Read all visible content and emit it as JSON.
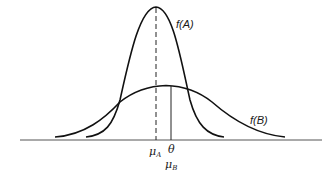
{
  "diagram": {
    "type": "overlapping-normal-distributions",
    "colors": {
      "stroke": "#111111",
      "axis": "#444444",
      "background": "#ffffff"
    },
    "curves": [
      {
        "id": "A",
        "label": "f(A)",
        "mean_symbol": "μ",
        "mean_subscript": "A",
        "shape": "narrow-tall"
      },
      {
        "id": "B",
        "label": "f(B)",
        "mean_symbol": "μ",
        "mean_subscript": "B",
        "shape": "wide-short"
      }
    ],
    "markers": {
      "mu_a": {
        "symbol": "μ",
        "subscript": "A",
        "line_style": "dashed"
      },
      "theta": {
        "symbol": "θ",
        "line_style": "solid"
      },
      "mu_b": {
        "symbol": "μ",
        "subscript": "B"
      }
    }
  }
}
